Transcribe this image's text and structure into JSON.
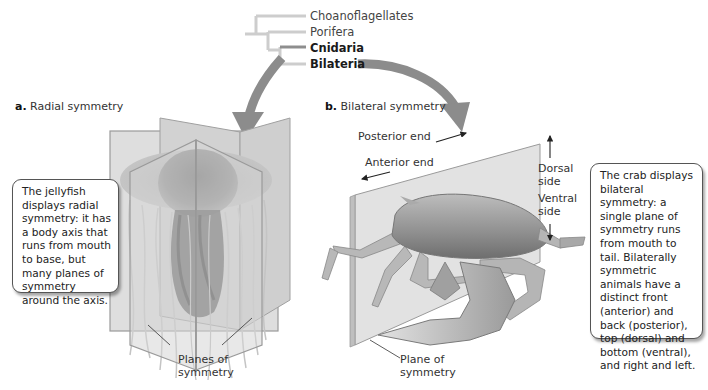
{
  "phylogeny": {
    "taxa": [
      {
        "label": "Choanoflagellates",
        "bold": false
      },
      {
        "label": "Porifera",
        "bold": false
      },
      {
        "label": "Cnidaria",
        "bold": true
      },
      {
        "label": "Bilateria",
        "bold": true
      }
    ]
  },
  "panel_a": {
    "letter": "a.",
    "title": "Radial symmetry",
    "callout": "The jellyfish displays radial symmetry: it has a body axis that runs from mouth to base, but many planes of symmetry around the axis.",
    "plane_label_line1": "Planes of",
    "plane_label_line2": "symmetry"
  },
  "panel_b": {
    "letter": "b.",
    "title": "Bilateral symmetry",
    "posterior_label": "Posterior end",
    "anterior_label": "Anterior end",
    "dorsal_label_line1": "Dorsal",
    "dorsal_label_line2": "side",
    "ventral_label_line1": "Ventral",
    "ventral_label_line2": "side",
    "callout": "The crab displays bilateral symmetry: a single plane of symmetry runs from mouth to tail. Bilaterally symmetric animals have a distinct front (anterior) and back (posterior), top (dorsal) and bottom (ventral), and right and left.",
    "plane_label_line1": "Plane of",
    "plane_label_line2": "symmetry"
  },
  "colors": {
    "arrow_gray": "#8c8c8c",
    "tree_light": "#c8c8c8",
    "tree_dark": "#8e8e8e",
    "plane_fill": "#d9d9d9",
    "plane_edge": "#9a9a9a"
  }
}
